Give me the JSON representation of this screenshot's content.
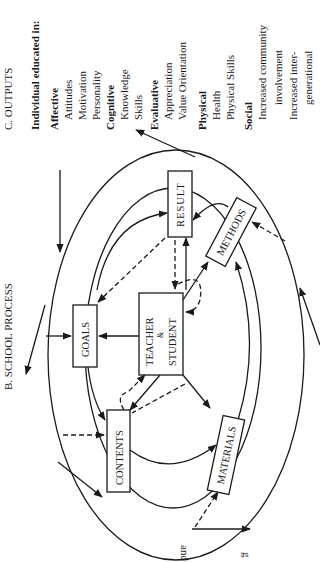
{
  "diagram": {
    "orientation": "rotated 90deg counter-clockwise",
    "sections": {
      "school_process": {
        "title": "B. SCHOOL PROCESS"
      },
      "outputs": {
        "title": "C. OUTPUTS",
        "heading": "Individual educated in:",
        "groups": [
          {
            "label": "Affective",
            "items": [
              "Attitudes",
              "Motivation",
              "Personality"
            ]
          },
          {
            "label": "Cognitive",
            "items": [
              "Knowledge",
              "Skills"
            ]
          },
          {
            "label": "Evaluative",
            "items": [
              "Appreciation",
              "Value Orientation"
            ]
          },
          {
            "label": "Physical",
            "items": [
              "Health",
              "Physical Skills"
            ]
          },
          {
            "label": "Social",
            "items": [
              "Increased community",
              "involvement",
              "Increased inter-",
              "generational"
            ]
          }
        ]
      }
    },
    "nodes": {
      "result": "RESULT",
      "methods": "METHODS",
      "goals": "GOALS",
      "teacher_student": [
        "TEACHER",
        "&",
        "STUDENT"
      ],
      "contents": "CONTENTS",
      "materials": "MATERIALS"
    },
    "partial_labels": {
      "inputs_fragment_1": "nts)",
      "inputs_fragment_2": "and",
      "inputs_fragment_3": "g"
    }
  }
}
